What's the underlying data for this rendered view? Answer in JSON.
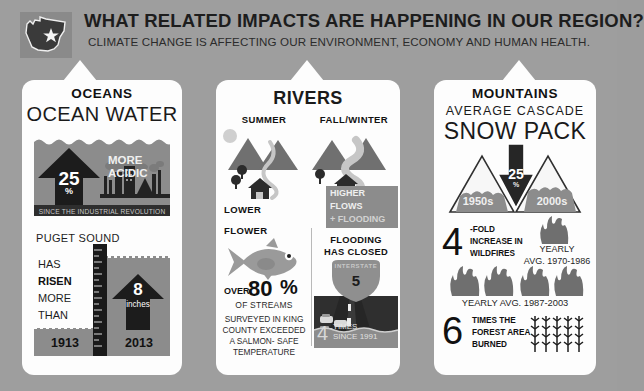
{
  "header": {
    "title": "WHAT RELATED IMPACTS ARE HAPPENING IN OUR REGION?",
    "subtitle": "CLIMATE CHANGE IS AFFECTING OUR ENVIRONMENT, ECONOMY AND HUMAN HEALTH.",
    "badge_icon": "washington-state-icon"
  },
  "colors": {
    "background": "#9e9e9e",
    "panel": "#fdfdfd",
    "mid_gray": "#8c8c8c",
    "dark": "#2e2e2e",
    "text": "#1a1a1a"
  },
  "oceans": {
    "kicker": "OCEANS",
    "heading": "OCEAN WATER",
    "acid_value": "25",
    "acid_unit": "%",
    "acid_label_line1": "MORE",
    "acid_label_line2": "ACIDIC",
    "acid_footer": "SINCE THE INDUSTRIAL REVOLUTION",
    "sound_title": "PUGET SOUND",
    "risen_lines": [
      "HAS",
      "RISEN",
      "MORE",
      "THAN"
    ],
    "rise_value": "8",
    "rise_unit": "inches",
    "year_start": "1913",
    "year_end": "2013"
  },
  "rivers": {
    "kicker": "RIVERS",
    "heading": "RIVERS",
    "season_left": "SUMMER",
    "season_right": "FALL/WINTER",
    "left_caption": "LOWER",
    "left_caption2": "FLOWER",
    "right_caption_lines": [
      "HIGHER",
      "FLOWS",
      "+ FLOODING"
    ],
    "streams_pre": "OVER",
    "streams_value": "80",
    "streams_unit": "%",
    "streams_post": "OF STREAMS",
    "streams_detail": [
      "SURVEYED IN KING",
      "COUNTY EXCEEDED",
      "A SALMON- SAFE",
      "TEMPERATURE"
    ],
    "flood_line1": "FLOODING",
    "flood_line2": "HAS CLOSED",
    "shield_label": "INTERSTATE",
    "shield_number": "5",
    "flood_count": "4",
    "flood_count_line1": "TIMES",
    "flood_count_line2": "SINCE 1991"
  },
  "mountains": {
    "kicker": "MOUNTAINS",
    "heading_small": "AVERAGE  CASCADE",
    "heading_big": "SNOW PACK",
    "drop_value": "25",
    "drop_unit": "%",
    "decade_left": "1950s",
    "decade_right": "2000s",
    "wildfire_value": "4",
    "wildfire_lines": [
      "-FOLD",
      "INCREASE IN",
      "WILDFIRES"
    ],
    "yearly_label_line1": "YEARLY",
    "yearly_label_line2": "AVG. 1970-1986",
    "yearly_label_bottom": "YEARLY AVG. 1987-2003",
    "burned_value": "6",
    "burned_lines": [
      "TIMES THE",
      "FOREST AREA",
      "BURNED"
    ]
  }
}
